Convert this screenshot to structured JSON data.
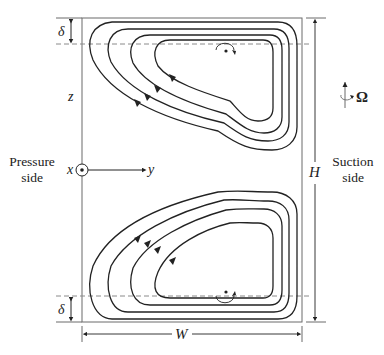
{
  "figure": {
    "type": "secondary-flow-schematic",
    "labels": {
      "delta_top": "δ",
      "delta_bottom": "δ",
      "z_axis": "z",
      "x_axis": "x",
      "y_axis": "y",
      "height": "H",
      "width": "W",
      "omega": "Ω"
    },
    "sides": {
      "pressure_line1": "Pressure",
      "pressure_line2": "side",
      "suction_line1": "Suction",
      "suction_line2": "side"
    },
    "vortices": [
      {
        "name": "upper-vortex",
        "streamlines": 4,
        "rotation": "clockwise"
      },
      {
        "name": "lower-vortex",
        "streamlines": 4,
        "rotation": "counter-clockwise"
      }
    ],
    "colors": {
      "stroke": "#222222",
      "box": "#6b6b6b",
      "dashed": "#8a8a8a"
    }
  }
}
